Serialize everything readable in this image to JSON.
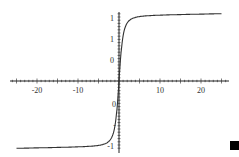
{
  "chart_data": {
    "type": "line",
    "title": "",
    "xlabel": "",
    "ylabel": "",
    "xlim": [
      -26,
      27
    ],
    "ylim": [
      -1.05,
      1.05
    ],
    "grid": false,
    "x_ticks": [
      -20,
      -10,
      10,
      20
    ],
    "x_tick_labels": [
      "-20",
      "-10",
      "10",
      "20"
    ],
    "y_tick_labels_upper": [
      "1",
      "1",
      "0"
    ],
    "y_tick_labels_lower": [
      "0",
      "-",
      "-1"
    ],
    "series": [
      {
        "name": "curve",
        "x": [
          -25,
          -20,
          -15,
          -10,
          -6,
          -4,
          -3,
          -2,
          -1.5,
          -1,
          -0.5,
          0,
          0.5,
          1,
          1.5,
          2,
          3,
          4,
          6,
          10,
          15,
          20,
          25
        ],
        "y": [
          -1.0,
          -0.99,
          -0.98,
          -0.95,
          -0.9,
          -0.85,
          -0.8,
          -0.72,
          -0.62,
          -0.5,
          -0.3,
          0,
          0.3,
          0.5,
          0.62,
          0.72,
          0.8,
          0.85,
          0.9,
          0.95,
          0.98,
          0.99,
          1.0
        ]
      }
    ]
  },
  "corner_marker": "black-square"
}
